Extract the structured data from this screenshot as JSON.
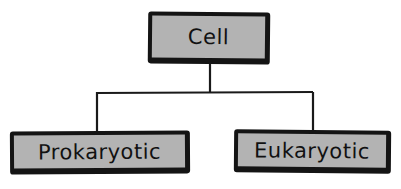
{
  "diagram": {
    "type": "tree",
    "root": {
      "label": "Cell"
    },
    "children": [
      {
        "label": "Prokaryotic"
      },
      {
        "label": "Eukaryotic"
      }
    ]
  },
  "colors": {
    "node_fill": "#b3b3b3",
    "node_border": "#141414",
    "connector": "#1a1a1a",
    "background": "#ffffff"
  }
}
